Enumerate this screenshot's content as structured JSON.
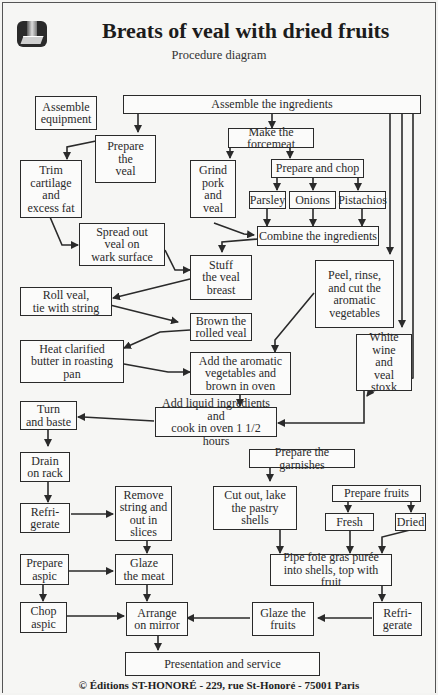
{
  "header": {
    "title": "Breats of veal with dried fruits",
    "subtitle": "Procedure diagram",
    "logo_icon": "book-spotlight-icon"
  },
  "nodes": {
    "assemble_equipment": "Assemble\nequipment",
    "assemble_ingredients": "Assemble the ingredients",
    "prepare_veal": "Prepare\nthe\nveal",
    "make_forcemeat": "Make the forcemeat",
    "trim_cartilage": "Trim\ncartilage\nand\nexcess fat",
    "grind_pork": "Grind\npork\nand\nveal",
    "prepare_chop": "Prepare and chop",
    "parsley": "Parsley",
    "onions": "Onions",
    "pistachios": "Pistachios",
    "spread_veal": "Spread out\nveal on\nwark surface",
    "combine_ingredients": "Combine the ingredients",
    "stuff_breast": "Stuff\nthe veal\nbreast",
    "peel_rinse": "Peel, rinse,\nand cut the\naromatic\nvegetables",
    "roll_veal": "Roll veal,\ntie with string",
    "brown_rolled": "Brown the\nrolled veal",
    "heat_butter": "Heat clarified\nbutter in roasting\npan",
    "add_aromatic": "Add the aromatic\nvegetables and\nbrown in oven",
    "white_wine": "White wine\nand\nveal\nstoxk",
    "turn_baste": "Turn\nand baste",
    "add_liquid": "Add liquid ingredients and\ncook in oven 1 1/2 hours",
    "drain_rack": "Drain\non rack",
    "prepare_garnishes": "Prepare the garnishes",
    "refrigerate_1": "Refri-\ngerate",
    "remove_string": "Remove\nstring and\nout in\nslices",
    "cut_pastry": "Cut out, lake\nthe pastry\nshells",
    "prepare_fruits": "Prepare fruits",
    "fresh": "Fresh",
    "dried": "Dried",
    "prepare_aspic": "Prepare\naspic",
    "glaze_meat": "Glaze\nthe meat",
    "pipe_foie_gras": "Pipe foie gras purée\ninto shells, top with fruit",
    "chop_aspic": "Chop\naspic",
    "arrange_mirror": "Arrange\non mirror",
    "glaze_fruits": "Glaze the\nfruits",
    "refrigerate_2": "Refri-\ngerate",
    "presentation": "Presentation and service"
  },
  "footer": {
    "copyright": "© Éditions ST-HONORÉ - 229, rue St-Honoré - 75001 Paris"
  },
  "colors": {
    "line": "#2a2a2a",
    "background": "#f6f6f4",
    "box_fill": "#fbfbfa"
  }
}
